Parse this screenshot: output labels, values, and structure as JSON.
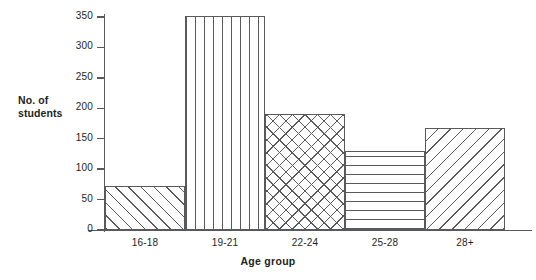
{
  "chart_data": {
    "type": "bar",
    "title": "",
    "xlabel": "Age group",
    "ylabel": "No. of students",
    "ylabel_lines": [
      "No. of",
      "students"
    ],
    "categories": [
      "16-18",
      "19-21",
      "22-24",
      "25-28",
      "28+"
    ],
    "values": [
      72,
      352,
      190,
      130,
      168
    ],
    "yticks": [
      0,
      50,
      100,
      150,
      200,
      250,
      300,
      350
    ],
    "ylim": [
      0,
      350
    ],
    "grid": false,
    "legend": null,
    "bar_styles": [
      "diagonal-forward-hatch",
      "vertical-hatch",
      "cross-hatch",
      "horizontal-hatch",
      "diagonal-back-hatch"
    ],
    "colors": {
      "line": "#58595b",
      "text": "#231f20",
      "fill": "#ffffff"
    }
  }
}
